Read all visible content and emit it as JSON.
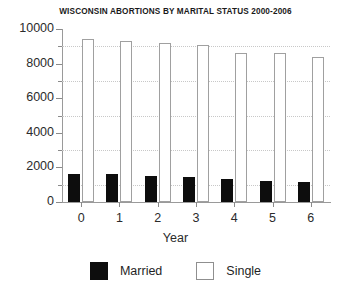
{
  "chart_data": {
    "type": "bar",
    "title": "WISCONSIN ABORTIONS BY MARITAL STATUS 2000-2006",
    "xlabel": "Year",
    "ylabel": "",
    "categories": [
      "0",
      "1",
      "2",
      "3",
      "4",
      "5",
      "6"
    ],
    "series": [
      {
        "name": "Married",
        "color": "#0d0d0d",
        "values": [
          1600,
          1620,
          1520,
          1470,
          1350,
          1200,
          1180
        ]
      },
      {
        "name": "Single",
        "color": "#ffffff",
        "values": [
          9450,
          9300,
          9200,
          9100,
          8600,
          8600,
          8400
        ]
      }
    ],
    "ylim": [
      0,
      10000
    ],
    "ytick_labels": [
      "0",
      "2000",
      "4000",
      "6000",
      "8000",
      "10000"
    ],
    "ytick_values": [
      0,
      2000,
      4000,
      6000,
      8000,
      10000
    ],
    "yminor_values": [
      1000,
      3000,
      5000,
      7000,
      9000
    ],
    "grid": true,
    "grid_style": "dotted",
    "legend_position": "bottom",
    "legend": [
      "Married",
      "Single"
    ]
  }
}
